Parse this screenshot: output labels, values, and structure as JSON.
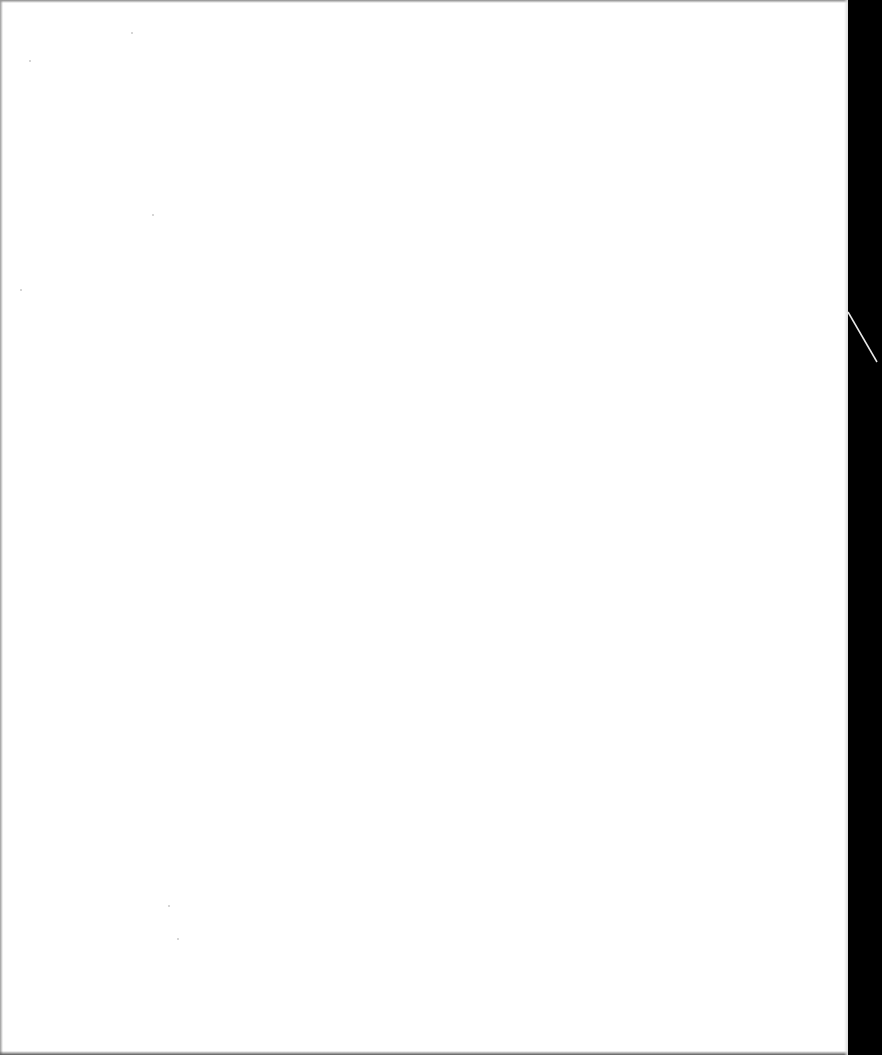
{
  "document": {
    "type": "scanned-page",
    "content": "",
    "is_blank": true
  },
  "colors": {
    "page": "#ffffff",
    "scanner_background": "#000000",
    "edge_shadow": "#8a8a8a"
  },
  "specks": [
    {
      "x": 131,
      "y": 32
    },
    {
      "x": 29,
      "y": 60
    },
    {
      "x": 152,
      "y": 214
    },
    {
      "x": 20,
      "y": 289
    },
    {
      "x": 177,
      "y": 938
    },
    {
      "x": 168,
      "y": 905
    }
  ]
}
